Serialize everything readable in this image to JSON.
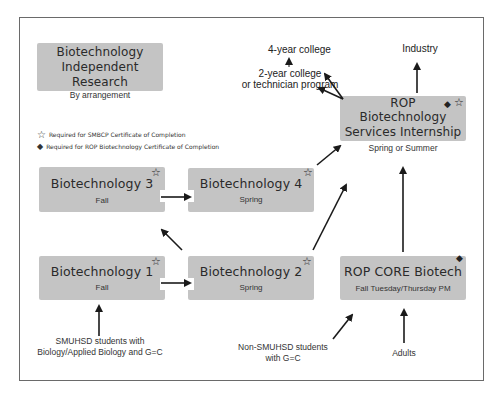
{
  "legend": {
    "star": {
      "icon": "star-outline-icon",
      "label": "Required for SMBCP Certificate of Completion"
    },
    "diamond": {
      "icon": "diamond-filled-icon",
      "label": "Required for ROP Biotechnology Certificate of Completion"
    }
  },
  "courses": {
    "independent": {
      "title_lines": [
        "Biotechnology",
        "Independent",
        "Research"
      ],
      "schedule": "By arrangement",
      "markers": []
    },
    "bio3": {
      "title": "Biotechnology 3",
      "schedule": "Fall",
      "markers": [
        "star"
      ]
    },
    "bio4": {
      "title": "Biotechnology 4",
      "schedule": "Spring",
      "markers": [
        "star"
      ]
    },
    "bio1": {
      "title": "Biotechnology 1",
      "schedule": "Fall",
      "markers": [
        "star"
      ]
    },
    "bio2": {
      "title": "Biotechnology 2",
      "schedule": "Spring",
      "markers": [
        "star"
      ]
    },
    "internship": {
      "title_lines": [
        "ROP",
        "Biotechnology",
        "Services Internship"
      ],
      "schedule": "Spring or Summer",
      "markers": [
        "diamond",
        "star"
      ]
    },
    "core": {
      "title": "ROP CORE Biotech",
      "schedule": "Fall Tuesday/Thursday PM",
      "markers": [
        "diamond"
      ]
    }
  },
  "destinations": {
    "four_year": "4-year college",
    "two_year_lines": [
      "2-year college",
      "or technician program"
    ],
    "industry": "Industry"
  },
  "entry_points": {
    "smuhsd_lines": [
      "SMUHSD students with",
      "Biology/Applied Biology and G=C"
    ],
    "non_smuhsd_lines": [
      "Non-SMUHSD students",
      "with G=C"
    ],
    "adults": "Adults"
  },
  "symbols": {
    "star": "☆",
    "diamond": "◆"
  },
  "colors": {
    "box": "#c4c4c4",
    "frame": "#6a6a6a",
    "arrow": "#1a1a1a"
  }
}
